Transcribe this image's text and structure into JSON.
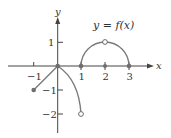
{
  "graph": {
    "title": "y = f(x)",
    "x_axis_label": "x",
    "y_axis_label": "y",
    "x_ticks": [
      {
        "value": -1,
        "label": "−1"
      },
      {
        "value": 1,
        "label": "1"
      },
      {
        "value": 2,
        "label": "2"
      },
      {
        "value": 3,
        "label": "3"
      }
    ],
    "y_ticks": [
      {
        "value": 1,
        "label": "1"
      },
      {
        "value": -1,
        "label": "−1"
      },
      {
        "value": -2,
        "label": "−2"
      }
    ],
    "colors": {
      "axis": "#333333",
      "curve": "#7a7a7a",
      "point": "#6e6e6e"
    },
    "pieces": [
      {
        "type": "line",
        "from": [
          -1,
          -1
        ],
        "to": [
          0,
          0
        ],
        "endpoints": [
          "closed",
          "closed"
        ]
      },
      {
        "type": "curve",
        "from": [
          0,
          0
        ],
        "to": [
          1,
          -2
        ],
        "endpoints": [
          "closed",
          "open"
        ]
      },
      {
        "type": "semicircle",
        "center": [
          2,
          0
        ],
        "radius": 1,
        "endpoints": [
          "closed",
          "closed"
        ],
        "open_point": [
          2,
          1
        ]
      }
    ],
    "closed_points": [
      [
        -1,
        -1
      ],
      [
        0,
        0
      ],
      [
        1,
        0
      ],
      [
        2,
        0
      ],
      [
        3,
        0
      ]
    ],
    "open_points": [
      [
        1,
        -2
      ],
      [
        2,
        1
      ]
    ]
  }
}
